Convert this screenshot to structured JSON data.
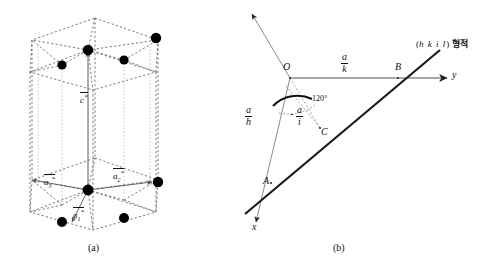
{
  "figure": {
    "panels": [
      {
        "id": "a",
        "caption": "(a)",
        "description": "hexagonal reciprocal unit cell"
      },
      {
        "id": "b",
        "caption": "(b)",
        "description": "Miller-Bravais index trace geometry"
      }
    ]
  },
  "panel_a": {
    "caption": "(a)",
    "vectors": [
      {
        "name": "a1-star",
        "base": "a",
        "sub": "1",
        "star": "*"
      },
      {
        "name": "a2-star",
        "base": "a",
        "sub": "2",
        "star": "*"
      },
      {
        "name": "a3-star",
        "base": "a",
        "sub": "3",
        "star": "*"
      },
      {
        "name": "c-star",
        "base": "c",
        "sub": "",
        "star": "*"
      }
    ],
    "labels": {
      "a1": "a",
      "a1_sub": "1",
      "a2": "a",
      "a2_sub": "2",
      "a3": "a",
      "a3_sub": "3",
      "c": "c",
      "star": "*"
    },
    "lattice_point_count": 8,
    "style": {
      "edge": "dashed",
      "vector": "solid-arrow",
      "node_color": "#000000"
    }
  },
  "panel_b": {
    "caption": "(b)",
    "origin_label": "O",
    "point_b_label": "B",
    "point_c_label": "C",
    "point_a_label": "A",
    "axis_x_label": "x",
    "axis_y_label": "y",
    "angle_label": "120°",
    "trace_label_paren_open": "(",
    "trace_label_indices": "h k i l",
    "trace_label_paren_close": ")",
    "trace_label_korean": "형적",
    "intercepts": [
      {
        "name": "a-over-k",
        "num": "a",
        "den": "k",
        "sign": ""
      },
      {
        "name": "a-over-h",
        "num": "a",
        "den": "h",
        "sign": ""
      },
      {
        "name": "minus-a-over-i",
        "num": "a",
        "den": "i",
        "sign": "-"
      }
    ]
  },
  "colors": {
    "ink": "#111111",
    "node": "#000000",
    "thin_line": "#7a7a7a",
    "dashed": "#555555",
    "background": "#ffffff"
  }
}
